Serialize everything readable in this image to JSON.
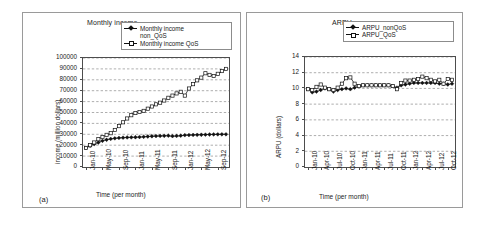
{
  "figure": {
    "panels": [
      {
        "caption": "(a)",
        "chart_data": {
          "type": "line",
          "title": "Monthly income",
          "xlabel": "Time (per month)",
          "ylabel": "income (million dollars)",
          "ylim": [
            0,
            100000
          ],
          "ytick_labels": [
            "100000",
            "90000",
            "80000",
            "70000",
            "60000",
            "50000",
            "40000",
            "30000",
            "20000",
            "10000",
            "0"
          ],
          "ytick_values": [
            100000,
            90000,
            80000,
            70000,
            60000,
            50000,
            40000,
            30000,
            20000,
            10000,
            0
          ],
          "xtick_labels": [
            "Jan-10",
            "May-10",
            "Sep-10",
            "Jan-11",
            "May-11",
            "Sep-11",
            "Jan-12",
            "May-12",
            "Sep-12"
          ],
          "xtick_index": [
            0,
            4,
            8,
            12,
            16,
            20,
            24,
            28,
            32
          ],
          "grid": "horizontal-dashed",
          "legend_position": "top-right",
          "x": [
            "Jan-10",
            "Feb-10",
            "Mar-10",
            "Apr-10",
            "May-10",
            "Jun-10",
            "Jul-10",
            "Aug-10",
            "Sep-10",
            "Oct-10",
            "Nov-10",
            "Dec-10",
            "Jan-11",
            "Feb-11",
            "Mar-11",
            "Apr-11",
            "May-11",
            "Jun-11",
            "Jul-11",
            "Aug-11",
            "Sep-11",
            "Oct-11",
            "Nov-11",
            "Dec-11",
            "Jan-12",
            "Feb-12",
            "Mar-12",
            "Apr-12",
            "May-12",
            "Jun-12",
            "Jul-12",
            "Aug-12",
            "Sep-12",
            "Oct-12",
            "Nov-12"
          ],
          "series": [
            {
              "name": "Monthly income non_QoS",
              "marker": "diamond",
              "values": [
                17500,
                19500,
                21000,
                22500,
                24000,
                25000,
                25800,
                26300,
                26700,
                26900,
                27100,
                27200,
                27300,
                27500,
                27700,
                28000,
                28200,
                28400,
                28500,
                28600,
                28700,
                28300,
                28500,
                28700,
                29200,
                29300,
                29400,
                29500,
                29600,
                29700,
                29800,
                29900,
                29950,
                30000,
                30000
              ]
            },
            {
              "name": "Monthly income QoS",
              "marker": "square",
              "values": [
                17500,
                20000,
                22500,
                25500,
                27500,
                29500,
                31000,
                34000,
                37500,
                41000,
                44500,
                47500,
                49500,
                50500,
                51500,
                53500,
                55500,
                57500,
                59000,
                61000,
                63500,
                65500,
                67500,
                69000,
                65500,
                72000,
                76000,
                79500,
                82000,
                86000,
                84500,
                83500,
                85500,
                88000,
                90000
              ]
            }
          ]
        }
      },
      {
        "caption": "(b)",
        "chart_data": {
          "type": "line",
          "title": "ARPU",
          "xlabel": "Time (per month)",
          "ylabel": "ARPU (dollars)",
          "ylim": [
            0,
            14
          ],
          "ytick_labels": [
            "14",
            "12",
            "10",
            "8",
            "6",
            "4",
            "2",
            "0"
          ],
          "ytick_values": [
            14,
            12,
            10,
            8,
            6,
            4,
            2,
            0
          ],
          "xtick_labels": [
            "Jan-10",
            "Apr-10",
            "Jul-10",
            "Oct-10",
            "Jan-11",
            "Apr-11",
            "Jul-11",
            "Oct-11",
            "Jan-12",
            "Apr-12",
            "Jul-12",
            "Oct-12"
          ],
          "xtick_index": [
            0,
            3,
            6,
            9,
            12,
            15,
            18,
            21,
            24,
            27,
            30,
            33
          ],
          "grid": "horizontal-dashed",
          "legend_position": "top-right",
          "x": [
            "Jan-10",
            "Feb-10",
            "Mar-10",
            "Apr-10",
            "May-10",
            "Jun-10",
            "Jul-10",
            "Aug-10",
            "Sep-10",
            "Oct-10",
            "Nov-10",
            "Dec-10",
            "Jan-11",
            "Feb-11",
            "Mar-11",
            "Apr-11",
            "May-11",
            "Jun-11",
            "Jul-11",
            "Aug-11",
            "Sep-11",
            "Oct-11",
            "Nov-11",
            "Dec-11",
            "Jan-12",
            "Feb-12",
            "Mar-12",
            "Apr-12",
            "May-12",
            "Jun-12",
            "Jul-12",
            "Aug-12",
            "Sep-12",
            "Oct-12",
            "Nov-12"
          ],
          "series": [
            {
              "name": "ARPU_nonQoS",
              "marker": "diamond",
              "values": [
                9.9,
                9.5,
                9.6,
                9.8,
                10.0,
                9.9,
                9.6,
                9.8,
                9.9,
                10.0,
                9.9,
                10.1,
                10.3,
                10.4,
                10.4,
                10.4,
                10.4,
                10.4,
                10.4,
                10.4,
                10.3,
                10.1,
                10.4,
                10.5,
                10.6,
                10.7,
                10.7,
                10.7,
                10.7,
                10.7,
                10.7,
                10.6,
                10.6,
                10.5,
                10.6
              ]
            },
            {
              "name": "ARPU_QoS",
              "marker": "square",
              "values": [
                9.9,
                9.8,
                10.2,
                10.5,
                10.1,
                9.9,
                9.8,
                10.1,
                10.6,
                11.3,
                11.4,
                10.6,
                10.3,
                10.4,
                10.4,
                10.4,
                10.4,
                10.4,
                10.4,
                10.4,
                10.3,
                9.9,
                10.7,
                11.0,
                11.0,
                11.1,
                11.2,
                11.5,
                11.3,
                11.1,
                10.9,
                11.1,
                10.6,
                11.2,
                11.1
              ]
            }
          ]
        }
      }
    ]
  }
}
